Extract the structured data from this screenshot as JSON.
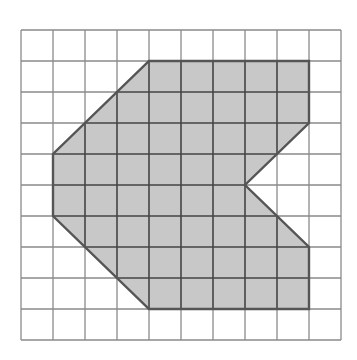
{
  "diagram": {
    "type": "grid-polygon",
    "grid": {
      "columns": 10,
      "rows": 10,
      "origin_x": 21,
      "origin_y": 30,
      "cell_width": 32,
      "cell_height": 31
    },
    "shape": {
      "vertices_grid": [
        [
          4,
          1
        ],
        [
          9,
          1
        ],
        [
          9,
          3
        ],
        [
          7,
          5
        ],
        [
          9,
          7
        ],
        [
          9,
          9
        ],
        [
          4,
          9
        ],
        [
          1,
          6
        ],
        [
          1,
          4
        ]
      ],
      "fill": "#c8c8c8",
      "stroke": "#555555"
    },
    "colors": {
      "background": "#ffffff",
      "grid_line": "#8a8a8a",
      "shape_grid_line": "#444444"
    }
  }
}
